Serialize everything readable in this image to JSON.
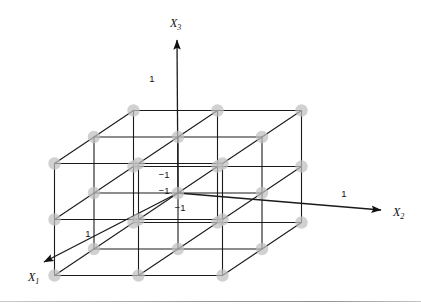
{
  "figure": {
    "kind": "3d-lattice-diagram",
    "background_color": "#ffffff",
    "line_color": "#1a1a1a",
    "node_color": "#bfbfbf",
    "node_radius": 6.2,
    "line_width": 1.1,
    "baseline_rule_color": "#9d9d9d"
  },
  "axes": [
    {
      "id": "x1",
      "label": "X",
      "subscript": "1",
      "label_x": 28,
      "label_y": 281,
      "tip_x": 44,
      "tip_y": 262,
      "tail_x": 178,
      "tail_y": 193
    },
    {
      "id": "x2",
      "label": "X",
      "subscript": "2",
      "label_x": 393,
      "label_y": 216,
      "tip_x": 381,
      "tip_y": 210,
      "tail_x": 178,
      "tail_y": 193
    },
    {
      "id": "x3",
      "label": "X",
      "subscript": "3",
      "label_x": 170,
      "label_y": 27,
      "tip_x": 177,
      "tip_y": 40,
      "tail_x": 178,
      "tail_y": 193
    }
  ],
  "tick_labels": [
    {
      "text": "1",
      "axis": "x3",
      "x": 152,
      "y": 82,
      "anchor": "middle"
    },
    {
      "text": "1",
      "axis": "x2",
      "x": 344,
      "y": 197,
      "anchor": "middle"
    },
    {
      "text": "1",
      "axis": "x1",
      "x": 88,
      "y": 237,
      "anchor": "middle"
    },
    {
      "text": "−1",
      "axis": "x3",
      "x": 164,
      "y": 178,
      "anchor": "middle"
    },
    {
      "text": "−1",
      "axis": "x1",
      "x": 164,
      "y": 194,
      "anchor": "middle"
    },
    {
      "text": "−1",
      "axis": "x2",
      "x": 180,
      "y": 211,
      "anchor": "middle"
    }
  ],
  "chart_data": {
    "type": "scatter",
    "title": "",
    "xlabel": "X1",
    "ylabel": "X2",
    "zlabel": "X3",
    "projection": {
      "origin_px": [
        178,
        193
      ],
      "e1_px": [
        -39.5,
        26.5
      ],
      "e2_px": [
        84.0,
        0.0
      ],
      "e3_px": [
        0.0,
        -56.0
      ],
      "note": "screen = origin + x1*e1 + x2*e2 + x3*e3 for coordinate values in {-1,0,1}"
    },
    "axis_ranges": {
      "x1": [
        -1,
        1
      ],
      "x2": [
        -1,
        1
      ],
      "x3": [
        -1,
        1
      ]
    },
    "levels": [
      -1,
      0,
      1
    ],
    "n_points": 27,
    "grid": true,
    "legend": "none",
    "points": [
      [
        -1,
        -1,
        -1
      ],
      [
        -1,
        -1,
        0
      ],
      [
        -1,
        -1,
        1
      ],
      [
        -1,
        0,
        -1
      ],
      [
        -1,
        0,
        0
      ],
      [
        -1,
        0,
        1
      ],
      [
        -1,
        1,
        -1
      ],
      [
        -1,
        1,
        0
      ],
      [
        -1,
        1,
        1
      ],
      [
        0,
        -1,
        -1
      ],
      [
        0,
        -1,
        0
      ],
      [
        0,
        -1,
        1
      ],
      [
        0,
        0,
        -1
      ],
      [
        0,
        0,
        0
      ],
      [
        0,
        0,
        1
      ],
      [
        0,
        1,
        -1
      ],
      [
        0,
        1,
        0
      ],
      [
        0,
        1,
        1
      ],
      [
        1,
        -1,
        -1
      ],
      [
        1,
        -1,
        0
      ],
      [
        1,
        -1,
        1
      ],
      [
        1,
        0,
        -1
      ],
      [
        1,
        0,
        0
      ],
      [
        1,
        0,
        1
      ],
      [
        1,
        1,
        -1
      ],
      [
        1,
        1,
        0
      ],
      [
        1,
        1,
        1
      ]
    ]
  }
}
